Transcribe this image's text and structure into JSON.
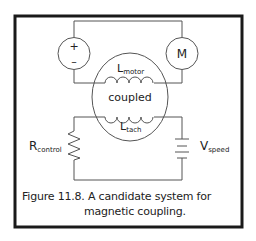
{
  "figure": {
    "caption_line1": "Figure 11.8.  A candidate system for",
    "caption_line2": "magnetic coupling."
  },
  "components": {
    "source": {
      "plus": "+",
      "minus": "–"
    },
    "motor": {
      "label": "M"
    },
    "coupling": {
      "label": "coupled"
    },
    "l_motor": {
      "main": "L",
      "sub": "motor"
    },
    "l_tach": {
      "main": "L",
      "sub": "tach"
    },
    "r_control": {
      "main": "R",
      "sub": "control"
    },
    "v_speed": {
      "main": "V",
      "sub": "speed"
    }
  },
  "colors": {
    "frame": "#1a1a1a",
    "wire": "#555555",
    "text": "#222222"
  }
}
